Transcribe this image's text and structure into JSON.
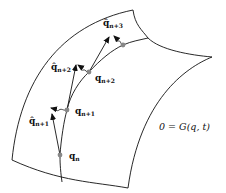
{
  "diagram": {
    "type": "manifold-projection",
    "manifold_equation": "0 = G(q, t)",
    "equation_parts": {
      "lhs": "0",
      "eq": "=",
      "fn": "G(",
      "q": "q",
      "comma": ", ",
      "t": "t",
      "close": ")"
    },
    "points": [
      {
        "label": "q",
        "sub": "n"
      },
      {
        "label": "q",
        "sub": "n+1"
      },
      {
        "label": "q",
        "sub": "n+2"
      }
    ],
    "predictions": [
      {
        "label": "q̂",
        "sub": "n+1"
      },
      {
        "label": "q̂",
        "sub": "n+2"
      },
      {
        "label": "q̂",
        "sub": "n+3"
      }
    ],
    "colors": {
      "line": "#111111",
      "point": "#888888"
    }
  }
}
